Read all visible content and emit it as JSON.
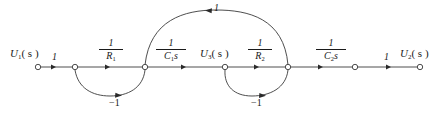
{
  "figure": {
    "type": "signal flow graph",
    "stroke_color": "#3a3a3a",
    "text_color": "#1a1a1a",
    "background": "#ffffff",
    "width": 444,
    "height": 118
  },
  "nodes": [
    {
      "id": "n1",
      "label_var": "U",
      "label_sub": "1",
      "label_arg": "( s )",
      "x": 38,
      "y": 67,
      "has_label": true
    },
    {
      "id": "n2",
      "label_var": "",
      "label_sub": "",
      "label_arg": "",
      "x": 75,
      "y": 67,
      "has_label": false
    },
    {
      "id": "n3",
      "label_var": "",
      "label_sub": "",
      "label_arg": "",
      "x": 145,
      "y": 67,
      "has_label": false
    },
    {
      "id": "n4",
      "label_var": "U",
      "label_sub": "3",
      "label_arg": "( s )",
      "x": 225,
      "y": 67,
      "has_label": true
    },
    {
      "id": "n5",
      "label_var": "",
      "label_sub": "",
      "label_arg": "",
      "x": 288,
      "y": 67,
      "has_label": false
    },
    {
      "id": "n6",
      "label_var": "",
      "label_sub": "",
      "label_arg": "",
      "x": 355,
      "y": 67,
      "has_label": false
    },
    {
      "id": "n7",
      "label_var": "U",
      "label_sub": "2",
      "label_arg": "( s )",
      "x": 420,
      "y": 67,
      "has_label": true
    }
  ],
  "node_labels": {
    "input": {
      "var": "U",
      "sub": "1",
      "arg": "( s )"
    },
    "middle": {
      "var": "U",
      "sub": "3",
      "arg": "( s )"
    },
    "output": {
      "var": "U",
      "sub": "2",
      "arg": "( s )"
    }
  },
  "branches": [
    {
      "id": "b1",
      "from": "n1",
      "to": "n2",
      "kind": "straight",
      "gain_type": "integer",
      "gain": "1"
    },
    {
      "id": "b2",
      "from": "n2",
      "to": "n3",
      "kind": "straight",
      "gain_type": "fraction",
      "num": "1",
      "den_var": "R",
      "den_sub": "1",
      "den_tail": ""
    },
    {
      "id": "b3",
      "from": "n3",
      "to": "n4",
      "kind": "straight",
      "gain_type": "fraction",
      "num": "1",
      "den_var": "C",
      "den_sub": "1",
      "den_tail": "s"
    },
    {
      "id": "b4",
      "from": "n4",
      "to": "n5",
      "kind": "straight",
      "gain_type": "fraction",
      "num": "1",
      "den_var": "R",
      "den_sub": "2",
      "den_tail": ""
    },
    {
      "id": "b5",
      "from": "n5",
      "to": "n6",
      "kind": "straight",
      "gain_type": "fraction",
      "num": "1",
      "den_var": "C",
      "den_sub": "2",
      "den_tail": "s"
    },
    {
      "id": "b6",
      "from": "n6",
      "to": "n7",
      "kind": "straight",
      "gain_type": "integer",
      "gain": "1"
    },
    {
      "id": "b7",
      "from": "n3",
      "to": "n2",
      "kind": "arc-below",
      "gain_type": "integer",
      "gain": "−1"
    },
    {
      "id": "b8",
      "from": "n5",
      "to": "n4",
      "kind": "arc-below",
      "gain_type": "integer",
      "gain": "−1"
    },
    {
      "id": "b9",
      "from": "n5",
      "to": "n3",
      "kind": "arc-above",
      "gain_type": "integer",
      "gain": "1"
    }
  ],
  "gain_labels": {
    "g_one_left": "1",
    "g_inv_r1": {
      "num": "1",
      "den_var": "R",
      "den_sub": "1",
      "den_tail": ""
    },
    "g_inv_c1s": {
      "num": "1",
      "den_var": "C",
      "den_sub": "1",
      "den_tail": "s"
    },
    "g_inv_r2": {
      "num": "1",
      "den_var": "R",
      "den_sub": "2",
      "den_tail": ""
    },
    "g_inv_c2s": {
      "num": "1",
      "den_var": "C",
      "den_sub": "2",
      "den_tail": "s"
    },
    "g_one_right": "1",
    "g_top_arc": "1",
    "g_fb_left": "−1",
    "g_fb_right": "−1"
  }
}
